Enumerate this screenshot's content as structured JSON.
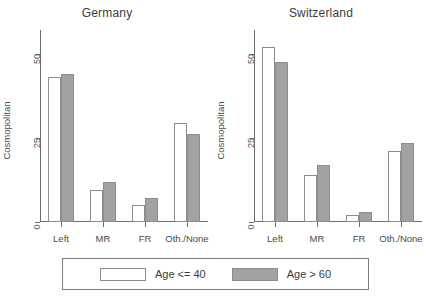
{
  "chart_data": {
    "type": "bar",
    "title": "",
    "xlabel": "",
    "ylabel": "Cosmopolitan",
    "ylim": [
      0,
      57
    ],
    "yticks": [
      0,
      25,
      50
    ],
    "ytick_labels": [
      "0",
      "25",
      "50"
    ],
    "grid": false,
    "legend_position": "bottom",
    "panels": [
      {
        "title": "Germany",
        "categories": [
          "Left",
          "MR",
          "FR",
          "Oth./None"
        ],
        "series": [
          {
            "name": "Age <= 40",
            "color": "#ffffff",
            "values": [
              43,
              9.5,
              5,
              29.5
            ]
          },
          {
            "name": "Age > 60",
            "color": "#a2a2a2",
            "values": [
              44,
              12,
              7,
              26
            ]
          }
        ]
      },
      {
        "title": "Switzerland",
        "categories": [
          "Left",
          "MR",
          "FR",
          "Oth./None"
        ],
        "series": [
          {
            "name": "Age <= 40",
            "color": "#ffffff",
            "values": [
              52,
              14,
              2,
              21
            ]
          },
          {
            "name": "Age > 60",
            "color": "#a2a2a2",
            "values": [
              47.5,
              17,
              3,
              23.5
            ]
          }
        ]
      }
    ]
  },
  "legend": {
    "entries": [
      {
        "label": "Age <= 40",
        "swatch": "light"
      },
      {
        "label": "Age > 60",
        "swatch": "dark"
      }
    ]
  },
  "colors": {
    "bar_light": "#ffffff",
    "bar_dark": "#a2a2a2",
    "bar_border": "#8d8d8d",
    "axis": "#6e6e6e",
    "text": "#3c3c3c"
  }
}
